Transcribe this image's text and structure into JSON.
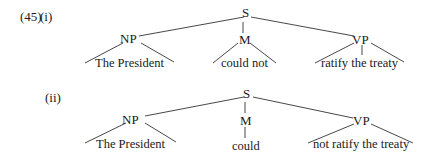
{
  "example_number": "(45)",
  "trees": [
    {
      "label": "(i)",
      "root": "S",
      "children": [
        {
          "label": "NP",
          "leaf": "The President",
          "leaf_style": "triangle"
        },
        {
          "label": "M",
          "leaf": "could not",
          "leaf_style": "triangle"
        },
        {
          "label": "VP",
          "leaf": "ratify the treaty",
          "leaf_style": "triangle"
        }
      ]
    },
    {
      "label": "(ii)",
      "root": "S",
      "children": [
        {
          "label": "NP",
          "leaf": "The President",
          "leaf_style": "triangle"
        },
        {
          "label": "M",
          "leaf": "could",
          "leaf_style": "line"
        },
        {
          "label": "VP",
          "leaf": "not ratify the treaty",
          "leaf_style": "triangle"
        }
      ]
    }
  ]
}
